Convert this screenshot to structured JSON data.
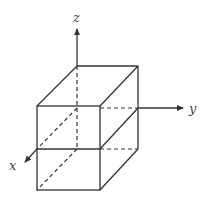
{
  "diagram": {
    "title": "",
    "axes": {
      "x": {
        "label": "x"
      },
      "y": {
        "label": "y"
      },
      "z": {
        "label": "z"
      }
    },
    "colors": {
      "line": "#333333",
      "background": "#ffffff"
    }
  }
}
